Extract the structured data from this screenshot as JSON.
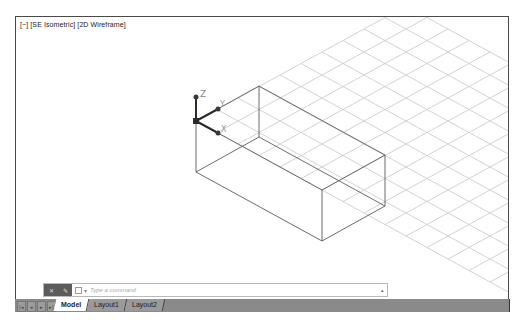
{
  "viewport": {
    "label": "[−] [SE Isometric] [2D Wireframe]",
    "ucs": {
      "z": "Z",
      "y": "Y",
      "x": "X"
    }
  },
  "command_line": {
    "placeholder": "Type a command",
    "buttons": [
      "close-icon",
      "wrench-icon"
    ],
    "prompt_icon": "command-prompt-icon",
    "dropdown_icon": "chevron-up-icon"
  },
  "tabs": {
    "nav": [
      "first-icon",
      "prev-icon",
      "next-icon",
      "last-icon"
    ],
    "items": [
      {
        "label": "Model",
        "active": true
      },
      {
        "label": "Layout1",
        "active": false
      },
      {
        "label": "Layout2",
        "active": false
      }
    ]
  },
  "colors": {
    "grid": "#c8c8c8",
    "geometry": "#555555",
    "ucs": "#333333",
    "tabbar": "#8a8a8a"
  }
}
